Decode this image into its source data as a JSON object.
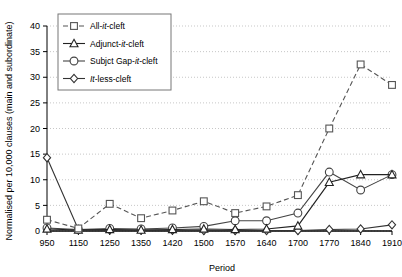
{
  "chart_data": {
    "type": "line",
    "title": "",
    "xlabel": "Period",
    "ylabel": "Normalised per 10,000 clauses (main and subordinate)",
    "categories": [
      "950",
      "1150",
      "1250",
      "1350",
      "1420",
      "1500",
      "1570",
      "1640",
      "1700",
      "1770",
      "1840",
      "1910"
    ],
    "ylim": [
      0,
      40
    ],
    "ytick_step": 5,
    "yticks": [
      "0",
      "5",
      "10",
      "15",
      "20",
      "25",
      "30",
      "35",
      "40"
    ],
    "grid": "horizontal-dotted",
    "legend_position": "top-left-inside",
    "series": [
      {
        "name": "All-it-cleft",
        "marker": "square",
        "line": "dashed",
        "color": "#555555",
        "values": [
          2.2,
          0.5,
          5.3,
          2.5,
          4.0,
          5.8,
          3.5,
          4.8,
          7.0,
          20.0,
          32.5,
          28.5
        ]
      },
      {
        "name": "Adjunct-it-cleft",
        "marker": "triangle",
        "line": "solid",
        "color": "#222222",
        "values": [
          0.4,
          0.2,
          0.3,
          0.2,
          0.3,
          0.4,
          0.3,
          0.4,
          1.0,
          9.5,
          11.0,
          11.0
        ]
      },
      {
        "name": "Subjct Gap-it-cleft",
        "marker": "circle",
        "line": "solid",
        "color": "#444444",
        "values": [
          0.6,
          0.3,
          0.5,
          0.4,
          0.6,
          0.9,
          2.0,
          2.0,
          3.5,
          11.5,
          8.0,
          11.0
        ]
      },
      {
        "name": "it-less-cleft",
        "marker": "diamond",
        "line": "solid",
        "color": "#333333",
        "values": [
          14.3,
          0.3,
          0.2,
          0.2,
          0.15,
          0.1,
          0.1,
          0.1,
          0.1,
          0.3,
          0.4,
          1.2
        ]
      }
    ],
    "series_correction": {
      "note": "square series at 1770=20.0, 1840=32.5, 1910=35.0; dip at 1840 is 28.5"
    },
    "legend": [
      {
        "label_prefix": "All-",
        "label_italic": "it",
        "label_suffix": "-cleft",
        "marker": "square",
        "line": "dashed"
      },
      {
        "label_prefix": "Adjunct-",
        "label_italic": "it",
        "label_suffix": "-cleft",
        "marker": "triangle",
        "line": "solid"
      },
      {
        "label_prefix": "Subjct Gap-",
        "label_italic": "it",
        "label_suffix": "-cleft",
        "marker": "circle",
        "line": "solid"
      },
      {
        "label_prefix": "",
        "label_italic": "It",
        "label_suffix": "-less-cleft",
        "marker": "diamond",
        "line": "solid"
      }
    ]
  },
  "axes": {
    "ylabel": "Normalised per 10,000 clauses (main and subordinate)",
    "xlabel": "Period"
  }
}
